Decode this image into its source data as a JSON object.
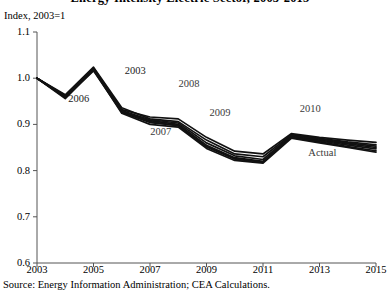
{
  "figure": {
    "title": "Energy Intensity Electric Sector, 2003-2015",
    "axis_unit_label": "Index, 2003=1",
    "source": "Source: Energy Information Administration; CEA Calculations."
  },
  "chart_data": {
    "type": "line",
    "title": "Energy Intensity Electric Sector, 2003-2015",
    "xlabel": "",
    "ylabel": "Index, 2003=1",
    "xlim": [
      2003,
      2015
    ],
    "ylim": [
      0.6,
      1.1
    ],
    "yticks": [
      "1.1",
      "1.0",
      "0.9",
      "0.8",
      "0.7",
      "0.6"
    ],
    "ytick_values": [
      1.1,
      1.0,
      0.9,
      0.8,
      0.7,
      0.6
    ],
    "xticks": [
      "2003",
      "2005",
      "2007",
      "2009",
      "2011",
      "2013",
      "2015"
    ],
    "xtick_values": [
      2003,
      2005,
      2007,
      2009,
      2011,
      2013,
      2015
    ],
    "grid": false,
    "legend": "inline-annotations",
    "line_color": "#111111",
    "annotations": [
      {
        "text": "2003",
        "x": 2006.6,
        "y": 1.013
      },
      {
        "text": "2006",
        "x": 2004.6,
        "y": 0.952
      },
      {
        "text": "2008",
        "x": 2008.5,
        "y": 0.985
      },
      {
        "text": "2007",
        "x": 2007.5,
        "y": 0.882
      },
      {
        "text": "2009",
        "x": 2009.6,
        "y": 0.923
      },
      {
        "text": "2010",
        "x": 2012.8,
        "y": 0.931
      },
      {
        "text": "Actual",
        "x": 2013.1,
        "y": 0.835
      }
    ],
    "series": [
      {
        "name": "Actual",
        "x": [
          2003,
          2004,
          2005,
          2006,
          2007,
          2008,
          2009,
          2010,
          2011,
          2012,
          2013,
          2014,
          2015
        ],
        "values": [
          1.0,
          0.96,
          1.02,
          0.928,
          0.908,
          0.9,
          0.855,
          0.828,
          0.82,
          0.872,
          0.862,
          0.852,
          0.843
        ]
      },
      {
        "name": "2003 vintage",
        "x": [
          2003,
          2004,
          2005,
          2006,
          2007,
          2008,
          2009,
          2010,
          2011,
          2012,
          2013,
          2014,
          2015
        ],
        "values": [
          1.0,
          0.962,
          1.022,
          0.932,
          0.916,
          0.912,
          0.872,
          0.842,
          0.836,
          0.88,
          0.872,
          0.866,
          0.861
        ]
      },
      {
        "name": "2006 vintage",
        "x": [
          2003,
          2004,
          2005,
          2006,
          2007,
          2008,
          2009,
          2010,
          2011,
          2012,
          2013,
          2014,
          2015
        ],
        "values": [
          1.0,
          0.958,
          1.016,
          0.926,
          0.904,
          0.898,
          0.852,
          0.826,
          0.818,
          0.874,
          0.866,
          0.858,
          0.85
        ]
      },
      {
        "name": "2007 vintage",
        "x": [
          2003,
          2004,
          2005,
          2006,
          2007,
          2008,
          2009,
          2010,
          2011,
          2012,
          2013,
          2014,
          2015
        ],
        "values": [
          1.0,
          0.964,
          1.024,
          0.936,
          0.912,
          0.906,
          0.866,
          0.836,
          0.83,
          0.878,
          0.87,
          0.862,
          0.856
        ]
      },
      {
        "name": "2008 vintage",
        "x": [
          2003,
          2004,
          2005,
          2006,
          2007,
          2008,
          2009,
          2010,
          2011,
          2012,
          2013,
          2014,
          2015
        ],
        "values": [
          1.0,
          0.956,
          1.018,
          0.924,
          0.9,
          0.894,
          0.848,
          0.822,
          0.816,
          0.87,
          0.86,
          0.85,
          0.84
        ]
      },
      {
        "name": "2009 vintage",
        "x": [
          2003,
          2004,
          2005,
          2006,
          2007,
          2008,
          2009,
          2010,
          2011,
          2012,
          2013,
          2014,
          2015
        ],
        "values": [
          1.0,
          0.961,
          1.021,
          0.93,
          0.91,
          0.903,
          0.86,
          0.832,
          0.824,
          0.876,
          0.868,
          0.86,
          0.853
        ]
      },
      {
        "name": "2010 vintage",
        "x": [
          2003,
          2004,
          2005,
          2006,
          2007,
          2008,
          2009,
          2010,
          2011,
          2012,
          2013,
          2014,
          2015
        ],
        "values": [
          1.0,
          0.959,
          1.019,
          0.929,
          0.906,
          0.897,
          0.851,
          0.825,
          0.819,
          0.873,
          0.864,
          0.855,
          0.847
        ]
      }
    ]
  }
}
